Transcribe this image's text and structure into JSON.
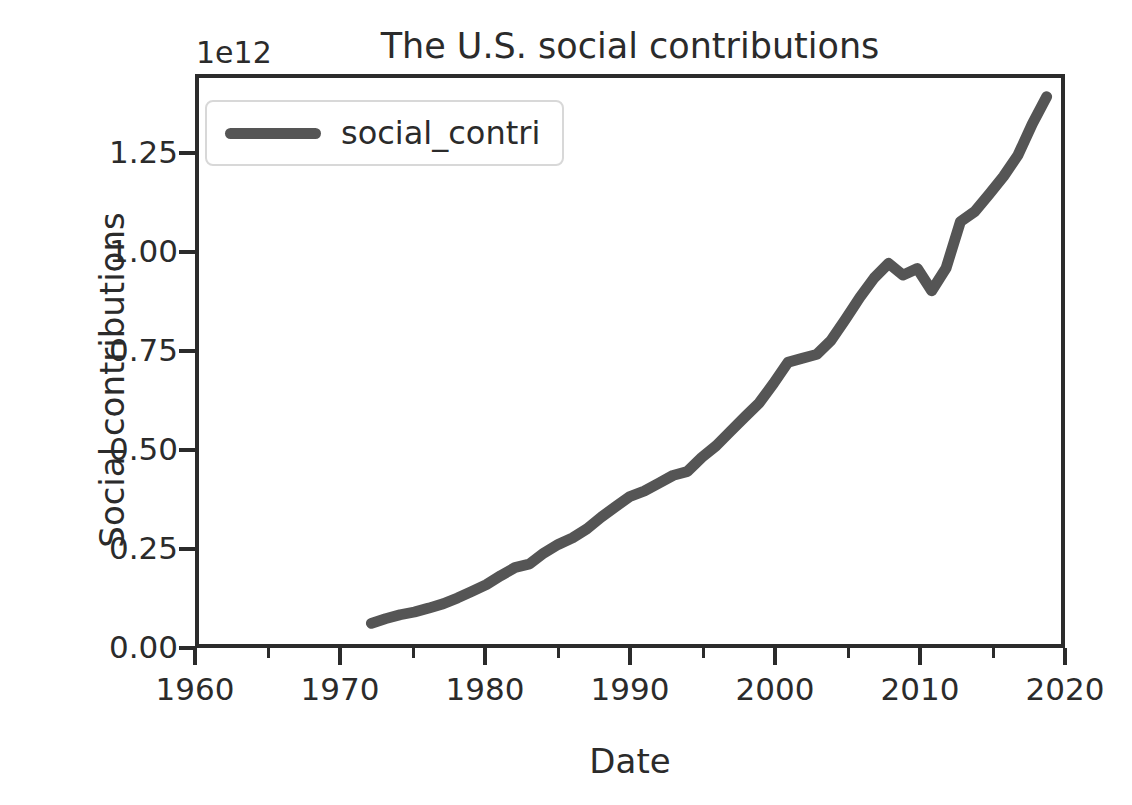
{
  "chart_data": {
    "type": "line",
    "title": "The U.S. social contributions",
    "xlabel": "Date",
    "ylabel": "Social contributions",
    "y_offset_text": "1e12",
    "y_offset_multiplier": 1000000000000,
    "grid": false,
    "legend_position": "upper left",
    "xlim": [
      1960,
      2020
    ],
    "ylim": [
      0,
      1.45
    ],
    "xticks": [
      1960,
      1970,
      1980,
      1990,
      2000,
      2010,
      2020
    ],
    "xticks_minor": [
      1965,
      1975,
      1985,
      1995,
      2005,
      2015
    ],
    "xtick_labels": [
      "1960",
      "1970",
      "1980",
      "1990",
      "2000",
      "2010",
      "2020"
    ],
    "yticks": [
      0.0,
      0.25,
      0.5,
      0.75,
      1.0,
      1.25
    ],
    "ytick_labels": [
      "0.00",
      "0.25",
      "0.50",
      "0.75",
      "1.00",
      "1.25"
    ],
    "series": [
      {
        "name": "social_contri",
        "color": "#555555",
        "linewidth": 11,
        "x": [
          1972,
          1973,
          1974,
          1975,
          1976,
          1977,
          1978,
          1979,
          1980,
          1981,
          1982,
          1983,
          1984,
          1985,
          1986,
          1987,
          1988,
          1989,
          1990,
          1991,
          1992,
          1993,
          1994,
          1995,
          1996,
          1997,
          1998,
          1999,
          2000,
          2001,
          2002,
          2003,
          2004,
          2005,
          2006,
          2007,
          2008,
          2009,
          2010,
          2011,
          2012,
          2013,
          2014,
          2015,
          2016,
          2017,
          2018,
          2019
        ],
        "y": [
          0.053,
          0.065,
          0.075,
          0.082,
          0.092,
          0.103,
          0.118,
          0.135,
          0.152,
          0.175,
          0.196,
          0.205,
          0.233,
          0.255,
          0.272,
          0.295,
          0.325,
          0.352,
          0.378,
          0.392,
          0.412,
          0.432,
          0.442,
          0.478,
          0.508,
          0.545,
          0.582,
          0.618,
          0.668,
          0.722,
          0.732,
          0.742,
          0.778,
          0.832,
          0.888,
          0.938,
          0.975,
          0.945,
          0.962,
          0.905,
          0.963,
          1.082,
          1.108,
          1.152,
          1.198,
          1.252,
          1.332,
          1.402
        ]
      }
    ]
  }
}
